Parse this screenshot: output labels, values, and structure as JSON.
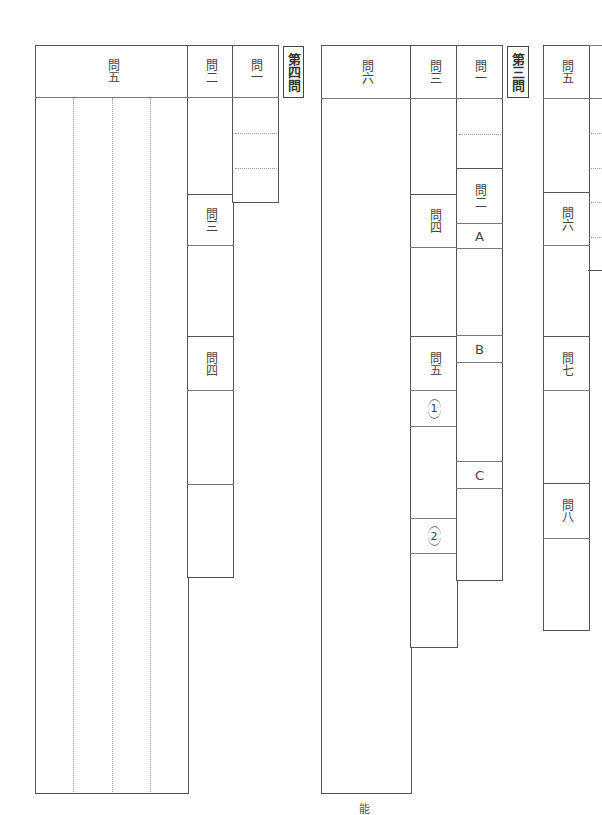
{
  "section4": {
    "tag": "第四問",
    "q5": {
      "label": "問五",
      "columns": 4
    },
    "q2": {
      "label": "問二"
    },
    "q3": {
      "label": "問三"
    },
    "q4": {
      "label": "問四"
    },
    "q1": {
      "label": "問一"
    }
  },
  "section3": {
    "tag": "第三問",
    "q6": {
      "label": "問六"
    },
    "q3": {
      "label": "問三"
    },
    "q4": {
      "label": "問四"
    },
    "q5": {
      "label": "問五",
      "sub1": "1",
      "sub2": "2"
    },
    "q1": {
      "label": "問一"
    },
    "q2": {
      "label": "問二",
      "partA": "A",
      "partB": "B",
      "partC": "C"
    }
  },
  "section2_partial": {
    "q5": {
      "label": "問五"
    },
    "q6": {
      "label": "問六"
    },
    "q7": {
      "label": "問七"
    },
    "q8": {
      "label": "問八"
    }
  },
  "footer": {
    "page_mark": "能"
  }
}
